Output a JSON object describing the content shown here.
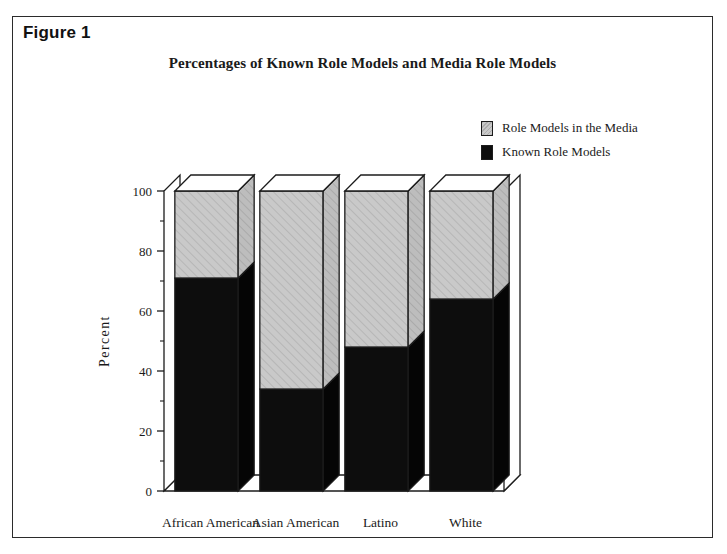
{
  "figure": {
    "label": "Figure 1"
  },
  "chart_data": {
    "type": "bar",
    "subtype": "stacked-3d",
    "title": "Percentages of Known Role Models and Media Role Models",
    "xlabel": "",
    "ylabel": "Percent",
    "categories": [
      "African American",
      "Asian American",
      "Latino",
      "White"
    ],
    "series": [
      {
        "name": "Known Role Models",
        "color": "#0d0d0d",
        "values": [
          71,
          34,
          48,
          64
        ]
      },
      {
        "name": "Role Models in the Media",
        "color": "#c9c9c9",
        "values": [
          29,
          66,
          52,
          36
        ]
      }
    ],
    "ylim": [
      0,
      100
    ],
    "yticks": [
      0,
      20,
      40,
      60,
      80,
      100
    ],
    "ytick_labels": [
      "0",
      "20",
      "40",
      "60",
      "80",
      "100"
    ],
    "minor_tick_interval": 10,
    "grid": false,
    "stacked_total": 100,
    "legend_position": "top-right",
    "legend_entries": [
      "Role Models in the Media",
      "Known Role Models"
    ]
  },
  "colors": {
    "known_role_models": "#0d0d0d",
    "media_role_models": "#c9c9c9",
    "frame": "#2b2b2b",
    "text": "#1a1a1a"
  }
}
